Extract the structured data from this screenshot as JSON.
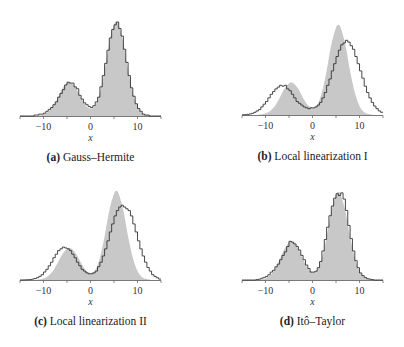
{
  "chart_data": [
    {
      "type": "bar",
      "id": "a",
      "caption_letter": "(a)",
      "caption_text": "Gauss–Hermite",
      "xlabel": "x",
      "ylabel": "",
      "xlim": [
        -15,
        15
      ],
      "xticks": [
        -15,
        -10,
        -5,
        0,
        5,
        10,
        15
      ],
      "xtick_labels": [
        {
          "x": -10,
          "label": "−10"
        },
        {
          "x": 0,
          "label": "0"
        },
        {
          "x": 10,
          "label": "10"
        }
      ],
      "grid": false,
      "legend": null,
      "series": [
        {
          "name": "reference density (shaded)",
          "style": "area",
          "color": "#c8c8c8",
          "x": [
            -15,
            -14,
            -13,
            -12,
            -11,
            -10,
            -9,
            -8,
            -7,
            -6,
            -5,
            -4.5,
            -4,
            -3,
            -2,
            -1,
            0,
            1,
            2,
            3,
            4,
            5,
            5.5,
            6,
            7,
            8,
            9,
            10,
            11,
            12,
            13,
            14,
            15
          ],
          "values": [
            0,
            0,
            0,
            0,
            0.005,
            0.016,
            0.044,
            0.1,
            0.19,
            0.29,
            0.35,
            0.36,
            0.35,
            0.29,
            0.19,
            0.11,
            0.08,
            0.11,
            0.25,
            0.49,
            0.78,
            0.97,
            1.0,
            0.97,
            0.78,
            0.49,
            0.25,
            0.1,
            0.03,
            0.01,
            0,
            0,
            0
          ]
        },
        {
          "name": "histogram",
          "style": "step",
          "color": "#333333",
          "bin_start": -15,
          "bin_width": 0.5,
          "values": [
            0,
            0,
            0,
            0,
            0,
            0,
            0.01,
            0.01,
            0.02,
            0.02,
            0.03,
            0.05,
            0.07,
            0.09,
            0.12,
            0.15,
            0.2,
            0.24,
            0.28,
            0.33,
            0.36,
            0.35,
            0.35,
            0.31,
            0.29,
            0.22,
            0.18,
            0.14,
            0.12,
            0.1,
            0.09,
            0.11,
            0.15,
            0.2,
            0.31,
            0.43,
            0.56,
            0.7,
            0.83,
            0.92,
            0.97,
            1.0,
            0.93,
            0.85,
            0.71,
            0.57,
            0.43,
            0.3,
            0.21,
            0.13,
            0.08,
            0.05,
            0.02,
            0.01,
            0.01,
            0,
            0,
            0,
            0,
            0
          ]
        }
      ]
    },
    {
      "type": "bar",
      "id": "b",
      "caption_letter": "(b)",
      "caption_text": "Local linearization I",
      "xlabel": "x",
      "ylabel": "",
      "xlim": [
        -15,
        15
      ],
      "xticks": [
        -15,
        -10,
        -5,
        0,
        5,
        10,
        15
      ],
      "xtick_labels": [
        {
          "x": -10,
          "label": "−10"
        },
        {
          "x": 0,
          "label": "0"
        },
        {
          "x": 10,
          "label": "10"
        }
      ],
      "grid": false,
      "legend": null,
      "series": [
        {
          "name": "reference density (shaded)",
          "style": "area",
          "color": "#c8c8c8",
          "x": [
            -15,
            -14,
            -13,
            -12,
            -11,
            -10,
            -9,
            -8,
            -7,
            -6,
            -5,
            -4.5,
            -4,
            -3,
            -2,
            -1,
            0,
            1,
            2,
            3,
            4,
            5,
            5.5,
            6,
            7,
            8,
            9,
            10,
            11,
            12,
            13,
            14,
            15
          ],
          "values": [
            0,
            0,
            0,
            0,
            0.005,
            0.016,
            0.044,
            0.1,
            0.19,
            0.29,
            0.35,
            0.36,
            0.35,
            0.29,
            0.19,
            0.11,
            0.08,
            0.11,
            0.25,
            0.49,
            0.78,
            0.97,
            1.0,
            0.97,
            0.78,
            0.49,
            0.25,
            0.1,
            0.03,
            0.01,
            0,
            0,
            0
          ]
        },
        {
          "name": "histogram",
          "style": "step",
          "color": "#333333",
          "bin_start": -15,
          "bin_width": 0.5,
          "values": [
            0.002,
            0.004,
            0.007,
            0.011,
            0.018,
            0.03,
            0.045,
            0.06,
            0.09,
            0.12,
            0.15,
            0.19,
            0.23,
            0.26,
            0.29,
            0.31,
            0.33,
            0.32,
            0.33,
            0.29,
            0.27,
            0.23,
            0.19,
            0.15,
            0.13,
            0.11,
            0.09,
            0.08,
            0.07,
            0.08,
            0.08,
            0.09,
            0.11,
            0.14,
            0.19,
            0.25,
            0.33,
            0.4,
            0.49,
            0.57,
            0.65,
            0.72,
            0.78,
            0.8,
            0.83,
            0.81,
            0.77,
            0.73,
            0.65,
            0.57,
            0.49,
            0.41,
            0.32,
            0.25,
            0.19,
            0.14,
            0.1,
            0.07,
            0.045,
            0.03
          ]
        }
      ]
    },
    {
      "type": "bar",
      "id": "c",
      "caption_letter": "(c)",
      "caption_text": "Local linearization II",
      "xlabel": "x",
      "ylabel": "",
      "xlim": [
        -15,
        15
      ],
      "xticks": [
        -15,
        -10,
        -5,
        0,
        5,
        10,
        15
      ],
      "xtick_labels": [
        {
          "x": -10,
          "label": "−10"
        },
        {
          "x": 0,
          "label": "0"
        },
        {
          "x": 10,
          "label": "10"
        }
      ],
      "grid": false,
      "legend": null,
      "series": [
        {
          "name": "reference density (shaded)",
          "style": "area",
          "color": "#c8c8c8",
          "x": [
            -15,
            -14,
            -13,
            -12,
            -11,
            -10,
            -9,
            -8,
            -7,
            -6,
            -5,
            -4.5,
            -4,
            -3,
            -2,
            -1,
            0,
            1,
            2,
            3,
            4,
            5,
            5.5,
            6,
            7,
            8,
            9,
            10,
            11,
            12,
            13,
            14,
            15
          ],
          "values": [
            0,
            0,
            0,
            0,
            0.005,
            0.016,
            0.044,
            0.1,
            0.19,
            0.29,
            0.35,
            0.36,
            0.35,
            0.29,
            0.19,
            0.11,
            0.08,
            0.11,
            0.25,
            0.49,
            0.78,
            0.97,
            1.0,
            0.97,
            0.78,
            0.49,
            0.25,
            0.1,
            0.03,
            0.01,
            0,
            0,
            0
          ]
        },
        {
          "name": "histogram",
          "style": "step",
          "color": "#333333",
          "bin_start": -15,
          "bin_width": 0.5,
          "values": [
            0,
            0.001,
            0.002,
            0.003,
            0.006,
            0.01,
            0.017,
            0.026,
            0.041,
            0.06,
            0.09,
            0.12,
            0.16,
            0.2,
            0.25,
            0.29,
            0.33,
            0.35,
            0.37,
            0.36,
            0.35,
            0.33,
            0.29,
            0.25,
            0.2,
            0.16,
            0.12,
            0.1,
            0.08,
            0.07,
            0.07,
            0.08,
            0.1,
            0.15,
            0.2,
            0.27,
            0.35,
            0.44,
            0.54,
            0.63,
            0.72,
            0.78,
            0.82,
            0.84,
            0.82,
            0.8,
            0.78,
            0.72,
            0.63,
            0.54,
            0.44,
            0.35,
            0.27,
            0.2,
            0.14,
            0.1,
            0.06,
            0.04,
            0.025,
            0.01
          ]
        }
      ]
    },
    {
      "type": "bar",
      "id": "d",
      "caption_letter": "(d)",
      "caption_text": "Itô–Taylor",
      "xlabel": "x",
      "ylabel": "",
      "xlim": [
        -15,
        15
      ],
      "xticks": [
        -15,
        -10,
        -5,
        0,
        5,
        10,
        15
      ],
      "xtick_labels": [
        {
          "x": -10,
          "label": "−10"
        },
        {
          "x": 0,
          "label": "0"
        },
        {
          "x": 10,
          "label": "10"
        }
      ],
      "grid": false,
      "legend": null,
      "series": [
        {
          "name": "reference density (shaded)",
          "style": "area",
          "color": "#c8c8c8",
          "x": [
            -15,
            -14,
            -13,
            -12,
            -11,
            -10,
            -9,
            -8,
            -7,
            -6,
            -5,
            -4.5,
            -4,
            -3,
            -2,
            -1,
            0,
            1,
            2,
            3,
            4,
            5,
            5.5,
            6,
            7,
            8,
            9,
            10,
            11,
            12,
            13,
            14,
            15
          ],
          "values": [
            0,
            0,
            0,
            0,
            0.006,
            0.02,
            0.054,
            0.12,
            0.23,
            0.35,
            0.43,
            0.44,
            0.43,
            0.35,
            0.23,
            0.13,
            0.09,
            0.11,
            0.25,
            0.49,
            0.78,
            0.97,
            1.0,
            0.97,
            0.78,
            0.49,
            0.25,
            0.1,
            0.03,
            0.01,
            0,
            0,
            0
          ]
        },
        {
          "name": "histogram",
          "style": "step",
          "color": "#333333",
          "bin_start": -15,
          "bin_width": 0.5,
          "values": [
            0,
            0,
            0,
            0,
            0,
            0,
            0.005,
            0.01,
            0.02,
            0.03,
            0.04,
            0.06,
            0.09,
            0.11,
            0.15,
            0.18,
            0.23,
            0.28,
            0.32,
            0.38,
            0.44,
            0.43,
            0.41,
            0.38,
            0.34,
            0.28,
            0.23,
            0.17,
            0.13,
            0.09,
            0.09,
            0.1,
            0.14,
            0.21,
            0.33,
            0.46,
            0.6,
            0.73,
            0.84,
            0.93,
            0.98,
            0.96,
            0.99,
            0.92,
            0.79,
            0.62,
            0.47,
            0.33,
            0.22,
            0.14,
            0.08,
            0.05,
            0.03,
            0.015,
            0.01,
            0.005,
            0,
            0,
            0,
            0
          ]
        }
      ]
    }
  ],
  "layout_panels": [
    {
      "x0": 20,
      "x1": 161,
      "baseline": 116,
      "scale": 94
    },
    {
      "x0": 242,
      "x1": 383,
      "baseline": 115,
      "scale": 90
    },
    {
      "x0": 20,
      "x1": 161,
      "baseline": 280,
      "scale": 89
    },
    {
      "x0": 242,
      "x1": 383,
      "baseline": 280,
      "scale": 88
    }
  ],
  "colors": {
    "shade": "#c8c8c8",
    "line": "#333333",
    "axis": "#555555"
  }
}
